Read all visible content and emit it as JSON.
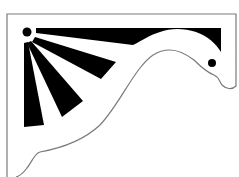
{
  "image": {
    "subject": "decorative corner bracket",
    "description": "Victorian gingerbread-style corner bracket with sunburst rays and swan-like scrolled curve",
    "colors": {
      "background": "#ffffff",
      "fill": "#000000",
      "outline": "#7a7a7a"
    },
    "elements": {
      "sun_dot": {
        "cx": 27,
        "cy": 32,
        "r": 4.5
      },
      "eye_dot": {
        "cx": 212,
        "cy": 63,
        "r": 4
      },
      "rays_count": 4
    }
  }
}
